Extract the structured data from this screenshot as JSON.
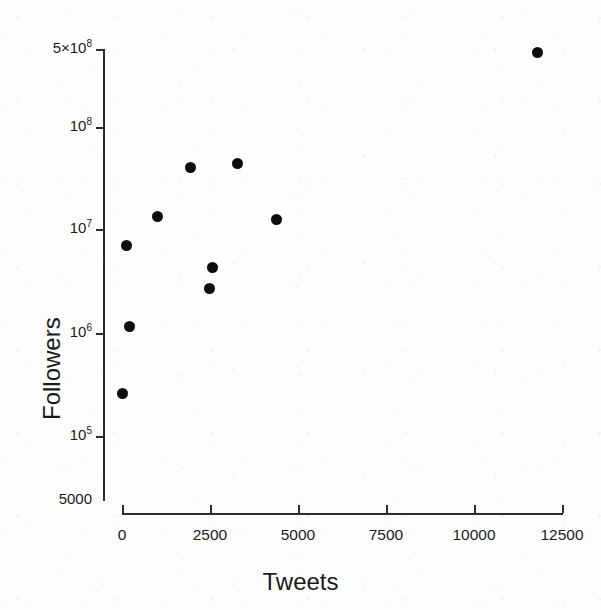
{
  "chart_data": {
    "type": "scatter",
    "title": "",
    "xlabel": "Tweets",
    "ylabel": "Followers",
    "xscale": "linear",
    "yscale": "log",
    "xlim": [
      0,
      12500
    ],
    "ylim": [
      5000,
      500000000
    ],
    "grid": false,
    "legend": null,
    "xticks": [
      0,
      2500,
      5000,
      7500,
      10000,
      12500
    ],
    "xticklabels": [
      "0",
      "2500",
      "5000",
      "7500",
      "10000",
      "12500"
    ],
    "yticks": [
      500000000,
      100000000,
      10000000,
      1000000,
      100000,
      5000
    ],
    "yticklabels": [
      "5×10⁸",
      "10⁸",
      "10⁷",
      "10⁶",
      "10⁵",
      "5000"
    ],
    "marker": "filled-circle",
    "marker_color": "#0d0d0d",
    "marker_size": 11,
    "points": [
      {
        "x": 11790,
        "y": 460000000
      },
      {
        "x": 3270,
        "y": 27000000
      },
      {
        "x": 1960,
        "y": 24000000
      },
      {
        "x": 995,
        "y": 6900000
      },
      {
        "x": 4375,
        "y": 6400000
      },
      {
        "x": 114,
        "y": 3300000
      },
      {
        "x": 2557,
        "y": 1900000
      },
      {
        "x": 2472,
        "y": 1100000
      },
      {
        "x": 199,
        "y": 420000
      },
      {
        "x": 28,
        "y": 75000
      }
    ]
  },
  "axes": {
    "x_title": "Tweets",
    "y_title": "Followers",
    "x_tick_labels": [
      "0",
      "2500",
      "5000",
      "7500",
      "10000",
      "12500"
    ],
    "y_tick_labels": [
      {
        "mantissa": "5×10",
        "exponent": "8"
      },
      {
        "mantissa": "10",
        "exponent": "8"
      },
      {
        "mantissa": "10",
        "exponent": "7"
      },
      {
        "mantissa": "10",
        "exponent": "6"
      },
      {
        "mantissa": "10",
        "exponent": "5"
      },
      {
        "mantissa": "5000",
        "exponent": ""
      }
    ],
    "axis_color": "#2e2e2e",
    "text_color": "#1b1b1b"
  },
  "geometry": {
    "plot_left": 103,
    "plot_right": 562,
    "x_zero": 122,
    "x_max_px": 562,
    "axis_y": 513,
    "y_axis_top": 49,
    "y_axis_bottom": 500,
    "y_tick_px": [
      49,
      127,
      229,
      333,
      436,
      500
    ],
    "x_tick_px": [
      122,
      210,
      298,
      386,
      474,
      562
    ]
  }
}
